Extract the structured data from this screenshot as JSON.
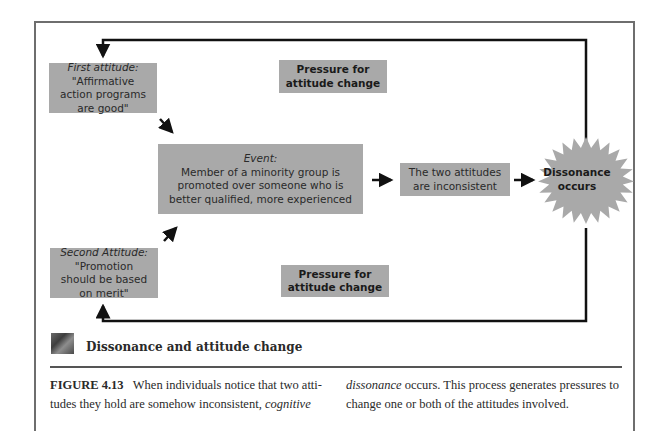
{
  "diagram": {
    "first_attitude": {
      "heading": "First attitude:",
      "text": "\"Affirmative action programs are good\""
    },
    "second_attitude": {
      "heading": "Second Attitude:",
      "text": "\"Promotion should be based on merit\""
    },
    "event": {
      "heading": "Event:",
      "text": "Member of a minority group is promoted over someone who is better qualified, more experienced"
    },
    "inconsistent": {
      "text": "The two attitudes are inconsistent"
    },
    "dissonance": {
      "line1": "Dissonance",
      "line2": "occurs"
    },
    "pressure_top": {
      "line1": "Pressure for",
      "line2": "attitude change"
    },
    "pressure_bottom": {
      "line1": "Pressure for",
      "line2": "attitude change"
    },
    "colors": {
      "box_fill": "#a9a9a9",
      "line": "#111111",
      "frame": "#6e6e6e"
    }
  },
  "caption": {
    "title": "Dissonance and attitude change",
    "figure_label": "FIGURE 4.13",
    "col1_text": "When individuals notice that two atti-tudes they hold are somehow inconsistent,",
    "col1_italic": "cognitive",
    "col2_italic": "dissonance",
    "col2_text": "occurs. This process generates pressures to change one or both of the attitudes involved."
  }
}
